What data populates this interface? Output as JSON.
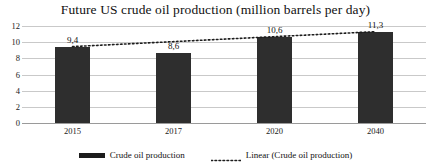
{
  "chart_data": {
    "type": "bar",
    "title": "Future US crude oil production (million barrels per day)",
    "xlabel": "",
    "ylabel": "",
    "categories": [
      "2015",
      "2017",
      "2020",
      "2040"
    ],
    "values": [
      9.4,
      8.6,
      10.6,
      11.3
    ],
    "value_labels": [
      "9,4",
      "8,6",
      "10,6",
      "11,3"
    ],
    "ylim": [
      0,
      12
    ],
    "yticks": [
      0,
      2,
      4,
      6,
      8,
      10,
      12
    ],
    "ytick_labels": [
      "0",
      "2",
      "4",
      "6",
      "8",
      "10",
      "12"
    ],
    "grid": true,
    "grid_axis": "y",
    "legend_position": "bottom",
    "series": [
      {
        "name": "Crude oil production",
        "type": "bar",
        "values": [
          9.4,
          8.6,
          10.6,
          11.3
        ],
        "color": "#2e2e2e"
      },
      {
        "name": "Linear (Crude oil production)",
        "type": "line",
        "style": "dotted",
        "color": "#1c1c1c",
        "endpoints": [
          {
            "x": "2015",
            "y": 9.45
          },
          {
            "x": "2040",
            "y": 11.3
          }
        ]
      }
    ],
    "colors": {
      "bar": "#2e2e2e",
      "trendline": "#1c1c1c",
      "gridline": "#c9c9c9",
      "axis": "#9a9a9a",
      "text": "#111111",
      "background": "#ffffff"
    }
  },
  "legend": {
    "entries": [
      {
        "label": "Crude oil production",
        "swatch": "solid-bar-swatch"
      },
      {
        "label": "Linear (Crude oil production)",
        "swatch": "dotted-line-swatch"
      }
    ]
  }
}
